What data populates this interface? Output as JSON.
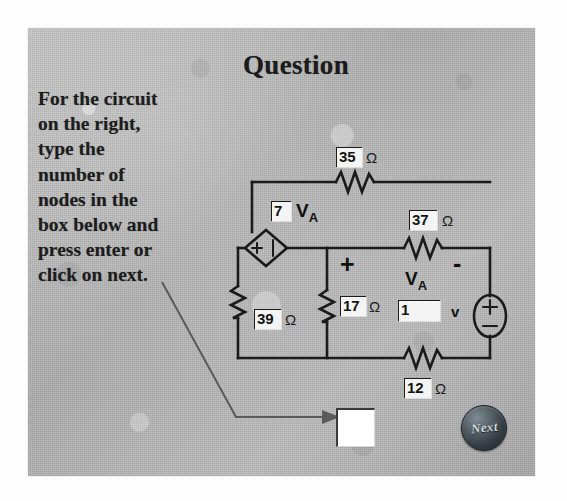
{
  "slide": {
    "title": "Question",
    "prompt": "For the circuit on the right, type the number of nodes in the box below and press enter or click on next."
  },
  "answer": {
    "value": "",
    "placeholder": ""
  },
  "next_button": {
    "label": "Next"
  },
  "circuit": {
    "dependent_source": {
      "gain": "7",
      "variable": "VA",
      "variable_base": "V",
      "variable_sub": "A",
      "polarity_plus": "+",
      "polarity_minus": "-"
    },
    "measured_voltage": {
      "label_base": "V",
      "label_sub": "A",
      "plus": "+",
      "minus": "-"
    },
    "source": {
      "value": "1",
      "unit": "v",
      "plus": "+",
      "minus": "−"
    },
    "resistors": [
      {
        "name": "r-top",
        "value": "35",
        "unit": "Ω"
      },
      {
        "name": "r-right",
        "value": "37",
        "unit": "Ω"
      },
      {
        "name": "r-left",
        "value": "39",
        "unit": "Ω"
      },
      {
        "name": "r-middle",
        "value": "17",
        "unit": "Ω"
      },
      {
        "name": "r-bottom",
        "value": "12",
        "unit": "Ω"
      }
    ]
  }
}
